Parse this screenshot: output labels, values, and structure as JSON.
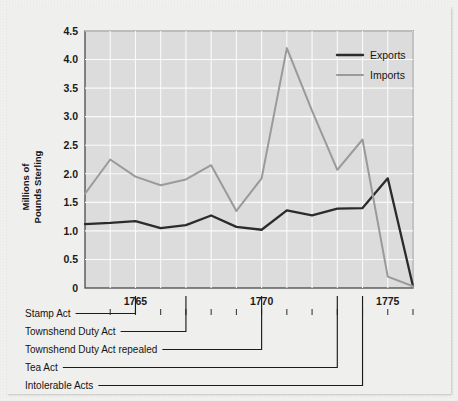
{
  "chart_data": {
    "type": "line",
    "title": "",
    "xlabel": "",
    "ylabel": "Millions of\nPounds Sterling",
    "ylabel_line1": "Millions of",
    "ylabel_line2": "Pounds Sterling",
    "xlim": [
      1763,
      1776
    ],
    "ylim": [
      0,
      4.5
    ],
    "grid": true,
    "legend_position": "top-right",
    "x": [
      1763,
      1764,
      1765,
      1766,
      1767,
      1768,
      1769,
      1770,
      1771,
      1772,
      1773,
      1774,
      1775,
      1776
    ],
    "yticks": [
      "0",
      "0.5",
      "1.0",
      "1.5",
      "2.0",
      "2.5",
      "3.0",
      "3.5",
      "4.0",
      "4.5"
    ],
    "ytick_values": [
      0,
      0.5,
      1.0,
      1.5,
      2.0,
      2.5,
      3.0,
      3.5,
      4.0,
      4.5
    ],
    "xticks": [
      "1765",
      "1770",
      "1775"
    ],
    "xtick_values": [
      1765,
      1770,
      1775
    ],
    "series": [
      {
        "name": "Exports",
        "color": "#2b2b2b",
        "values": [
          1.12,
          1.14,
          1.17,
          1.05,
          1.1,
          1.27,
          1.07,
          1.02,
          1.36,
          1.27,
          1.39,
          1.4,
          1.92,
          0.03
        ]
      },
      {
        "name": "Imports",
        "color": "#9a9a9a",
        "values": [
          1.65,
          2.25,
          1.95,
          1.8,
          1.9,
          2.15,
          1.35,
          1.92,
          4.2,
          3.1,
          2.07,
          2.6,
          0.2,
          0.03
        ]
      }
    ],
    "annotations": [
      {
        "label": "Stamp Act",
        "year": 1765
      },
      {
        "label": "Townshend Duty Act",
        "year": 1767
      },
      {
        "label": "Townshend Duty Act repealed",
        "year": 1770
      },
      {
        "label": "Tea Act",
        "year": 1773
      },
      {
        "label": "Intolerable Acts",
        "year": 1774
      }
    ]
  },
  "legend": {
    "items": [
      {
        "label": "Exports",
        "color": "#2b2b2b"
      },
      {
        "label": "Imports",
        "color": "#9a9a9a"
      }
    ]
  },
  "colors": {
    "exports": "#2b2b2b",
    "imports": "#9a9a9a",
    "plot_background": "#dcdcdc",
    "gridline": "#fafafa",
    "card_background": "#efefee",
    "page_background": "#f1f1ef",
    "axis": "#4a4a4a",
    "text": "#141414"
  }
}
